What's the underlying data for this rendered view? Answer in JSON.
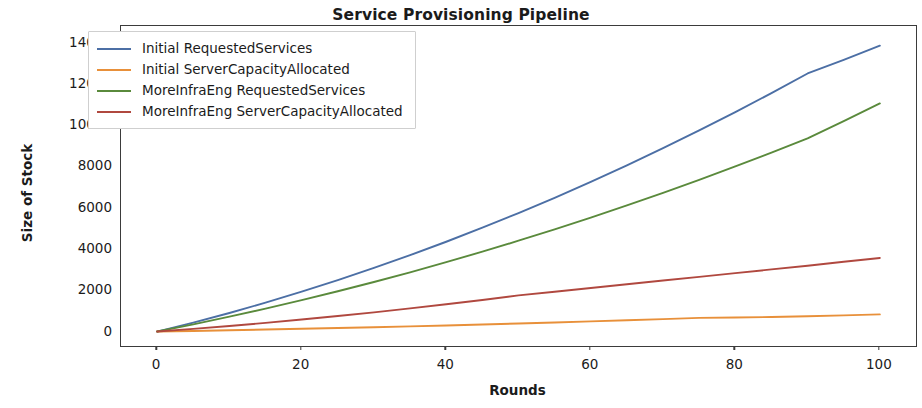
{
  "chart_data": {
    "type": "line",
    "title": "Service Provisioning Pipeline",
    "xlabel": "Rounds",
    "ylabel": "Size of Stock",
    "xlim": [
      -5,
      105
    ],
    "ylim": [
      -700,
      14800
    ],
    "xticks": [
      0,
      20,
      40,
      60,
      80,
      100
    ],
    "yticks": [
      0,
      2000,
      4000,
      6000,
      8000,
      10000,
      12000,
      14000
    ],
    "grid": false,
    "legend_position": "upper left",
    "x": [
      0,
      5,
      10,
      15,
      20,
      25,
      30,
      35,
      40,
      45,
      50,
      55,
      60,
      65,
      70,
      75,
      80,
      85,
      90,
      95,
      100
    ],
    "series": [
      {
        "name": "Initial RequestedServices",
        "color": "#4c6fa5",
        "values": [
          0,
          430,
          900,
          1400,
          1930,
          2490,
          3080,
          3700,
          4350,
          5030,
          5740,
          6480,
          7250,
          8050,
          8880,
          9740,
          10630,
          11550,
          12500,
          13160,
          13850
        ]
      },
      {
        "name": "Initial ServerCapacityAllocated",
        "color": "#e8903a",
        "values": [
          0,
          30,
          62,
          96,
          132,
          170,
          210,
          252,
          296,
          342,
          390,
          440,
          492,
          546,
          602,
          660,
          680,
          705,
          740,
          785,
          830
        ]
      },
      {
        "name": "MoreInfraEng RequestedServices",
        "color": "#5a8a3c",
        "values": [
          0,
          350,
          720,
          1110,
          1520,
          1950,
          2400,
          2870,
          3360,
          3870,
          4400,
          4950,
          5520,
          6110,
          6720,
          7350,
          8000,
          8670,
          9360,
          10190,
          11050
        ]
      },
      {
        "name": "MoreInfraEng ServerCapacityAllocated",
        "color": "#b0483f",
        "values": [
          0,
          130,
          270,
          420,
          580,
          750,
          930,
          1120,
          1320,
          1530,
          1750,
          1930,
          2110,
          2290,
          2470,
          2650,
          2830,
          3010,
          3190,
          3380,
          3560
        ]
      }
    ]
  },
  "axes": {
    "ytick_labels": [
      "0",
      "2000",
      "4000",
      "6000",
      "8000",
      "10000",
      "12000",
      "14000"
    ],
    "xtick_labels": [
      "0",
      "20",
      "40",
      "60",
      "80",
      "100"
    ]
  }
}
